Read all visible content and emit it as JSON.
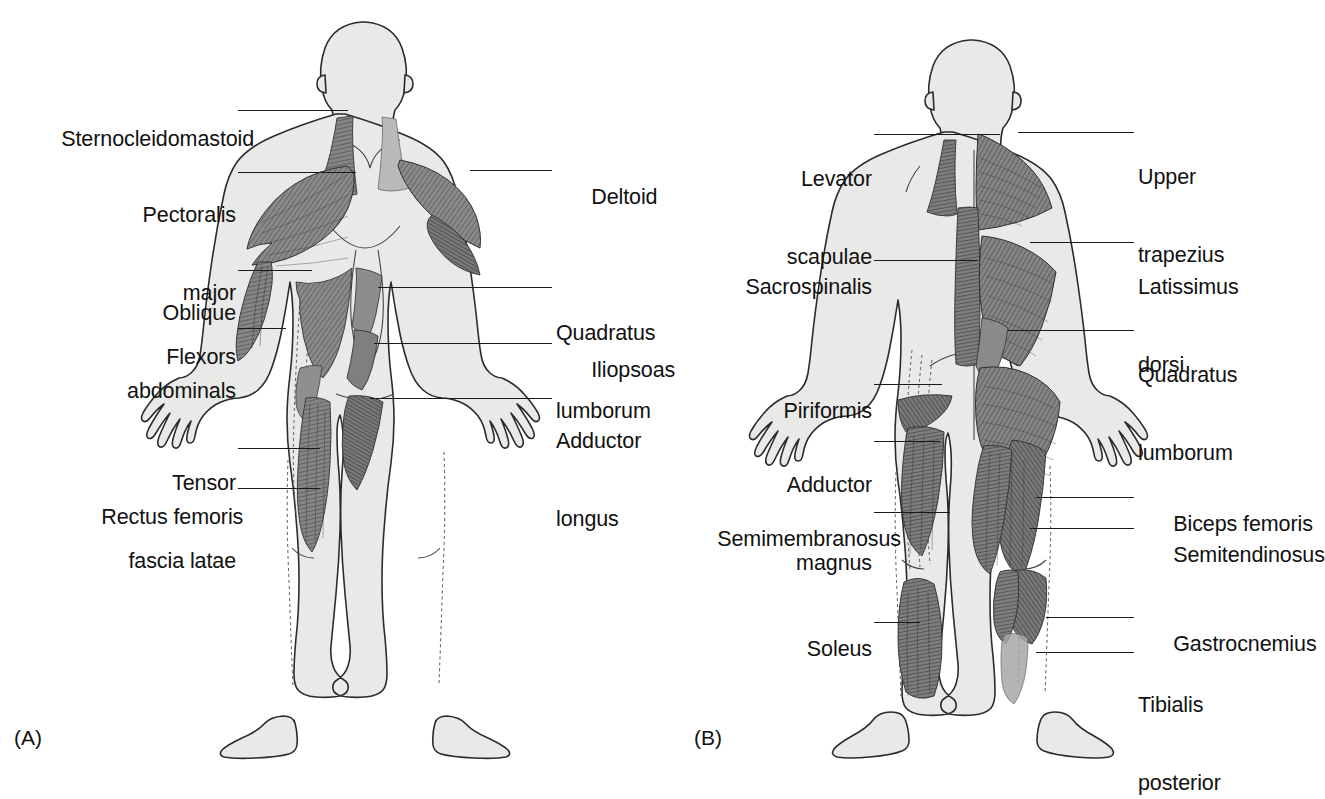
{
  "figure": {
    "background_color": "#ffffff",
    "ink_color": "#111111",
    "body_fill_color": "#e9e9e7",
    "muscle_fill_color": "#808080",
    "muscle_dark_color": "#6d6d6d"
  },
  "panels": [
    {
      "id": "A",
      "caption": "(A)",
      "view": "anterior",
      "labels_left": [
        {
          "key": "sternocleidomastoid",
          "text": "Sternocleidomastoid",
          "lines": [
            "Sternocleidomastoid"
          ]
        },
        {
          "key": "pectoralis-major",
          "text": "Pectoralis major",
          "lines": [
            "Pectoralis",
            "major"
          ]
        },
        {
          "key": "oblique-abdominals",
          "text": "Oblique abdominals",
          "lines": [
            "Oblique",
            "abdominals"
          ]
        },
        {
          "key": "flexors",
          "text": "Flexors",
          "lines": [
            "Flexors"
          ]
        },
        {
          "key": "tensor-fascia-latae",
          "text": "Tensor fascia latae",
          "lines": [
            "Tensor",
            "fascia latae"
          ]
        },
        {
          "key": "rectus-femoris",
          "text": "Rectus femoris",
          "lines": [
            "Rectus femoris"
          ]
        }
      ],
      "labels_right": [
        {
          "key": "deltoid",
          "text": "Deltoid",
          "lines": [
            "Deltoid"
          ]
        },
        {
          "key": "quadratus-lumborum",
          "text": "Quadratus lumborum",
          "lines": [
            "Quadratus",
            "lumborum"
          ]
        },
        {
          "key": "iliopsoas",
          "text": "Iliopsoas",
          "lines": [
            "Iliopsoas"
          ]
        },
        {
          "key": "adductor-longus",
          "text": "Adductor longus",
          "lines": [
            "Adductor",
            "longus"
          ]
        }
      ]
    },
    {
      "id": "B",
      "caption": "(B)",
      "view": "posterior",
      "labels_left": [
        {
          "key": "levator-scapulae",
          "text": "Levator scapulae",
          "lines": [
            "Levator",
            "scapulae"
          ]
        },
        {
          "key": "sacrospinalis",
          "text": "Sacrospinalis",
          "lines": [
            "Sacrospinalis"
          ]
        },
        {
          "key": "piriformis",
          "text": "Piriformis",
          "lines": [
            "Piriformis"
          ]
        },
        {
          "key": "adductor-magnus",
          "text": "Adductor magnus",
          "lines": [
            "Adductor",
            "magnus"
          ]
        },
        {
          "key": "semimembranosus",
          "text": "Semimembranosus",
          "lines": [
            "Semimembranosus"
          ]
        },
        {
          "key": "soleus",
          "text": "Soleus",
          "lines": [
            "Soleus"
          ]
        }
      ],
      "labels_right": [
        {
          "key": "upper-trapezius",
          "text": "Upper trapezius",
          "lines": [
            "Upper",
            "trapezius"
          ]
        },
        {
          "key": "latissimus-dorsi",
          "text": "Latissimus dorsi",
          "lines": [
            "Latissimus",
            "dorsi"
          ]
        },
        {
          "key": "quadratus-lumborum-b",
          "text": "Quadratus lumborum",
          "lines": [
            "Quadratus",
            "lumborum"
          ]
        },
        {
          "key": "biceps-femoris",
          "text": "Biceps femoris",
          "lines": [
            "Biceps femoris"
          ]
        },
        {
          "key": "semitendinosus",
          "text": "Semitendinosus",
          "lines": [
            "Semitendinosus"
          ]
        },
        {
          "key": "gastrocnemius",
          "text": "Gastrocnemius",
          "lines": [
            "Gastrocnemius"
          ]
        },
        {
          "key": "tibialis-posterior",
          "text": "Tibialis posterior",
          "lines": [
            "Tibialis",
            "posterior"
          ]
        }
      ]
    }
  ],
  "text": {
    "a_sternocleidomastoid": "Sternocleidomastoid",
    "a_pectoralis_1": "Pectoralis",
    "a_pectoralis_2": "major",
    "a_oblique_1": "Oblique",
    "a_oblique_2": "abdominals",
    "a_flexors": "Flexors",
    "a_tensor_1": "Tensor",
    "a_tensor_2": "fascia latae",
    "a_rectus_femoris": "Rectus femoris",
    "a_deltoid": "Deltoid",
    "a_quadratus_1": "Quadratus",
    "a_quadratus_2": "lumborum",
    "a_iliopsoas": "Iliopsoas",
    "a_adductor_1": "Adductor",
    "a_adductor_2": "longus",
    "a_caption": "(A)",
    "b_levator_1": "Levator",
    "b_levator_2": "scapulae",
    "b_sacrospinalis": "Sacrospinalis",
    "b_piriformis": "Piriformis",
    "b_adductor_1": "Adductor",
    "b_adductor_2": "magnus",
    "b_semimembranosus": "Semimembranosus",
    "b_soleus": "Soleus",
    "b_upper_1": "Upper",
    "b_upper_2": "trapezius",
    "b_latissimus_1": "Latissimus",
    "b_latissimus_2": "dorsi",
    "b_quadratus_1": "Quadratus",
    "b_quadratus_2": "lumborum",
    "b_biceps_femoris": "Biceps femoris",
    "b_semitendinosus": "Semitendinosus",
    "b_gastrocnemius": "Gastrocnemius",
    "b_tibialis_1": "Tibialis",
    "b_tibialis_2": "posterior",
    "b_caption": "(B)"
  }
}
